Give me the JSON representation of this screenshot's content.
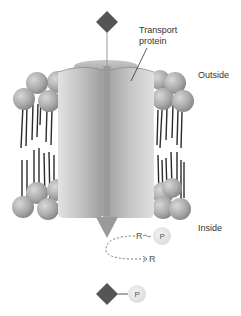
{
  "diagram": {
    "labels": {
      "transport_protein": "Transport protein",
      "outside": "Outside",
      "inside": "Inside"
    },
    "molecules": {
      "substrate_shape": "diamond",
      "donor_group": "R",
      "donor_after": "R",
      "phosphate": "P"
    },
    "colors": {
      "substrate": "#555555",
      "protein": "#b8b8b8",
      "phospholipid_head": "#a9a9a9",
      "lipid_tail": "#2b2b2b",
      "arrow": "#9a9a9a",
      "phosphate_circle": "#e6e6e6"
    },
    "components": [
      "substrate-molecule-outside",
      "transport-protein",
      "lipid-bilayer",
      "transport-arrow",
      "phosphate-transfer",
      "phosphorylated-substrate-inside"
    ]
  }
}
